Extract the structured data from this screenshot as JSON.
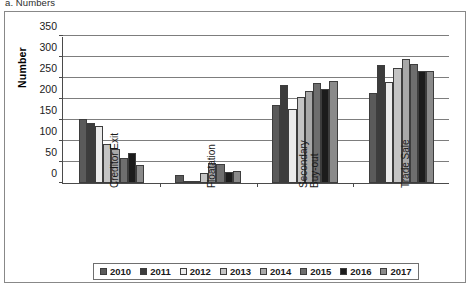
{
  "caption": "a. Numbers",
  "chart_data": {
    "type": "bar",
    "title": "a. Numbers",
    "xlabel": "",
    "ylabel": "Number",
    "ylim": [
      0,
      350
    ],
    "ytick_interval": 50,
    "yticks": [
      0,
      50,
      100,
      150,
      200,
      250,
      300,
      350
    ],
    "grid": true,
    "legend_position": "bottom",
    "categories": [
      "Creditor Exit",
      "Floatation",
      "Secondary Buy-out",
      "Trade Sale"
    ],
    "series": [
      {
        "name": "2010",
        "color": "#5a5a5a",
        "values": [
          153,
          20,
          186,
          215
        ]
      },
      {
        "name": "2011",
        "color": "#3c3c3c",
        "values": [
          142,
          4,
          234,
          281
        ]
      },
      {
        "name": "2012",
        "color": "#ebebeb",
        "values": [
          136,
          3,
          177,
          241
        ]
      },
      {
        "name": "2013",
        "color": "#c4c4c4",
        "values": [
          93,
          23,
          205,
          274
        ]
      },
      {
        "name": "2014",
        "color": "#a8a8a8",
        "values": [
          81,
          47,
          218,
          296
        ]
      },
      {
        "name": "2015",
        "color": "#6e6e6e",
        "values": [
          60,
          46,
          239,
          283
        ]
      },
      {
        "name": "2016",
        "color": "#1c1c1c",
        "values": [
          71,
          26,
          225,
          267
        ]
      },
      {
        "name": "2017",
        "color": "#8a8a8a",
        "values": [
          42,
          29,
          243,
          267
        ]
      }
    ]
  },
  "legend": {
    "items": [
      {
        "label": "2010"
      },
      {
        "label": "2011"
      },
      {
        "label": "2012"
      },
      {
        "label": "2013"
      },
      {
        "label": "2014"
      },
      {
        "label": "2015"
      },
      {
        "label": "2016"
      },
      {
        "label": "2017"
      }
    ]
  },
  "category_label_lines": [
    [
      "Creditor Exit"
    ],
    [
      "Floatation"
    ],
    [
      "Secondary",
      "Buy-out"
    ],
    [
      "Trade Sale"
    ]
  ]
}
